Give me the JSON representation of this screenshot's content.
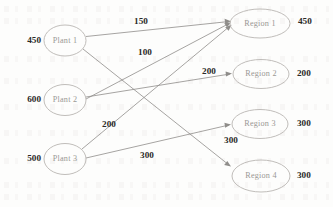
{
  "diagram": {
    "type": "transportation-network",
    "plants": [
      {
        "id": "plant1",
        "label": "Plant 1",
        "supply": "450",
        "cx": 65,
        "cy": 40.5
      },
      {
        "id": "plant2",
        "label": "Plant 2",
        "supply": "600",
        "cx": 65,
        "cy": 100.0
      },
      {
        "id": "plant3",
        "label": "Plant 3",
        "supply": "500",
        "cx": 65,
        "cy": 159.0
      }
    ],
    "regions": [
      {
        "id": "region1",
        "label": "Region 1",
        "demand": "450",
        "cx": 260,
        "cy": 23.5
      },
      {
        "id": "region2",
        "label": "Region 2",
        "demand": "200",
        "cx": 261,
        "cy": 74.0
      },
      {
        "id": "region3",
        "label": "Region 3",
        "demand": "300",
        "cx": 260,
        "cy": 124.0
      },
      {
        "id": "region4",
        "label": "Region 4",
        "demand": "300",
        "cx": 261,
        "cy": 176.0
      }
    ],
    "edges": [
      {
        "id": "e-p1-r1",
        "from": "plant1",
        "to": "region1",
        "label": "150",
        "lx": 141,
        "ly": 22
      },
      {
        "id": "e-p1-r4",
        "from": "plant1",
        "to": "region4",
        "label": "300",
        "lx": 231,
        "ly": 141
      },
      {
        "id": "e-p2-r1",
        "from": "plant2",
        "to": "region1",
        "label": "100",
        "lx": 145,
        "ly": 53
      },
      {
        "id": "e-p2-r2",
        "from": "plant2",
        "to": "region2",
        "label": "200",
        "lx": 209,
        "ly": 72
      },
      {
        "id": "e-p3-r1",
        "from": "plant3",
        "to": "region1",
        "label": "200",
        "lx": 109,
        "ly": 125
      },
      {
        "id": "e-p3-r3",
        "from": "plant3",
        "to": "region3",
        "label": "300",
        "lx": 147,
        "ly": 156
      }
    ],
    "node_geometry": {
      "plant_rx": 21,
      "plant_ry": 15.5,
      "region_rx": 29,
      "region_ry": 14.5
    },
    "colors": {
      "node_outline": "#b9b6b2",
      "node_text": "#9a9894",
      "edge_line": "#8f8d8a",
      "value_text": "#2b2a29",
      "background": "#fdfdfc"
    }
  }
}
